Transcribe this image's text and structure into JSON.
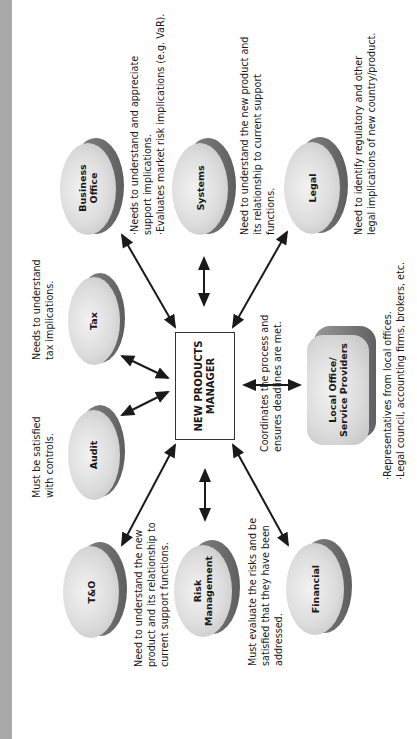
{
  "orientation": "rotated 90 degrees counter-clockwise",
  "center": {
    "label_line1": "NEW PRODUCTS",
    "label_line2": "MANAGER",
    "note": [
      "Coordinates the process and",
      "ensures deadlines are met."
    ]
  },
  "nodes": {
    "business_office": {
      "label_line1": "Business",
      "label_line2": "Office",
      "note": [
        "·Needs to understand and appreciate",
        "support implications.",
        "·Evaluates market risk implications (e.g. VaR)."
      ]
    },
    "systems": {
      "label": "Systems",
      "note": [
        "Need to understand the new product and",
        "its relationship to current support",
        "functions."
      ]
    },
    "legal": {
      "label": "Legal",
      "note": [
        "Need to identify regulatory and other",
        "legal implications of new country/product."
      ]
    },
    "tax": {
      "label": "Tax",
      "note": [
        "Needs to understand",
        "tax implications."
      ]
    },
    "audit": {
      "label": "Audit",
      "note": [
        "Must be satisfied",
        "with controls."
      ]
    },
    "t_and_o": {
      "label": "T&O",
      "note": [
        "Need to understand the new",
        "product and its relationship to",
        "current support functions."
      ]
    },
    "risk_management": {
      "label_line1": "Risk",
      "label_line2": "Management",
      "note": [
        "Must evaluate  the risks and be",
        "satisfied that they have been",
        "addressed."
      ]
    },
    "financial": {
      "label": "Financial"
    },
    "local_office": {
      "label_line1": "Local Office/",
      "label_line2": "Service Providers",
      "note": [
        "·Representatives from local offices.",
        "·Legal council, accounting firms, brokers, etc."
      ]
    }
  },
  "colors": {
    "strip": "#a9a9a9",
    "node_fill": "#dcdcdc",
    "node_shadow": "#6e6e6e",
    "arrow": "#1a1a1a"
  }
}
